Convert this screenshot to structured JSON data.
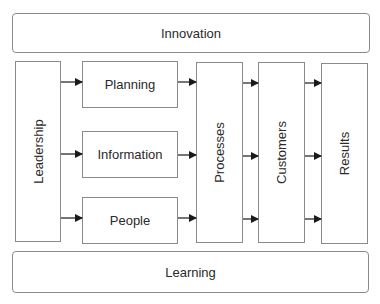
{
  "diagram": {
    "top_band": {
      "label": "Innovation"
    },
    "bottom_band": {
      "label": "Learning"
    },
    "driver": {
      "label": "Leadership"
    },
    "enablers": [
      {
        "label": "Planning"
      },
      {
        "label": "Information"
      },
      {
        "label": "People"
      }
    ],
    "stages": [
      {
        "label": "Processes"
      },
      {
        "label": "Customers"
      },
      {
        "label": "Results"
      }
    ],
    "colors": {
      "border": "#8a8a8a",
      "arrow": "#1a1a1a",
      "text": "#2a2a2a"
    }
  }
}
